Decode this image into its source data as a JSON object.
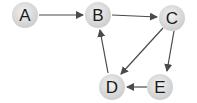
{
  "diagram": {
    "type": "directed-graph",
    "colors": {
      "node_fill_center": "#f0f0f0",
      "node_fill_edge": "#cfcfcf",
      "edge": "#4a4a4a",
      "label": "#1a1a1a"
    },
    "nodes": [
      {
        "id": "A",
        "label": "A",
        "x": 25,
        "y": 15
      },
      {
        "id": "B",
        "label": "B",
        "x": 98,
        "y": 15
      },
      {
        "id": "C",
        "label": "C",
        "x": 172,
        "y": 18
      },
      {
        "id": "D",
        "label": "D",
        "x": 112,
        "y": 87
      },
      {
        "id": "E",
        "label": "E",
        "x": 160,
        "y": 87
      }
    ],
    "edges": [
      {
        "from": "A",
        "to": "B"
      },
      {
        "from": "B",
        "to": "C"
      },
      {
        "from": "C",
        "to": "D"
      },
      {
        "from": "C",
        "to": "E"
      },
      {
        "from": "E",
        "to": "D"
      },
      {
        "from": "D",
        "to": "B"
      }
    ]
  }
}
